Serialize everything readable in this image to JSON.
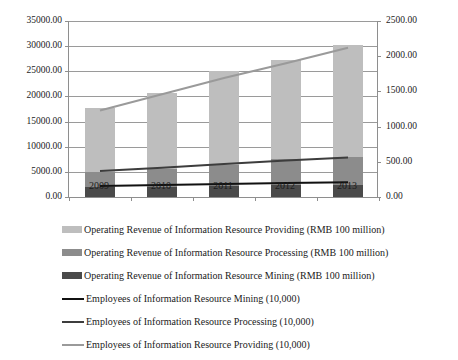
{
  "chart_data": {
    "type": "bar",
    "title": "",
    "subtitle": "",
    "xlabel": "",
    "ylabel": "",
    "categories": [
      "2009",
      "2010",
      "2011",
      "2012",
      "2013"
    ],
    "grid": true,
    "legend_position": "bottom",
    "axes": {
      "left": {
        "label": "",
        "min": 0,
        "max": 35000,
        "step": 5000,
        "ticks": [
          "0.00",
          "5000.00",
          "10000.00",
          "15000.00",
          "20000.00",
          "25000.00",
          "30000.00",
          "35000.00"
        ],
        "tick_values": [
          0,
          5000,
          10000,
          15000,
          20000,
          25000,
          30000,
          35000
        ],
        "unit": "RMB 100 million"
      },
      "right": {
        "label": "",
        "min": 0,
        "max": 2500,
        "step": 500,
        "ticks": [
          "0.00",
          "500.00",
          "1000.00",
          "1500.00",
          "2000.00",
          "2500.00"
        ],
        "tick_values": [
          0,
          500,
          1000,
          1500,
          2000,
          2500
        ],
        "unit": "10,000"
      }
    },
    "stacked": true,
    "series": [
      {
        "name": "Operating Revenue of Information Resource Mining (RMB 100 million)",
        "type": "bar",
        "axis": "left",
        "color": "#4a4a4a",
        "values": [
          1900,
          2000,
          2150,
          2300,
          2400
        ]
      },
      {
        "name": "Operating Revenue of Information Resource Processing (RMB 100 million)",
        "type": "bar",
        "axis": "left",
        "color": "#8c8c8c",
        "values": [
          3100,
          3500,
          4250,
          5200,
          5600
        ]
      },
      {
        "name": "Operating Revenue of Information Resource Providing (RMB 100 million)",
        "type": "bar",
        "axis": "left",
        "color": "#bebebe",
        "values": [
          12800,
          15200,
          18600,
          19800,
          22200
        ]
      },
      {
        "name": "Employees of Information Resource Mining (10,000)",
        "type": "line",
        "axis": "right",
        "color": "#111111",
        "values": [
          155,
          170,
          185,
          200,
          210
        ]
      },
      {
        "name": "Employees of Information Resource Processing (10,000)",
        "type": "line",
        "axis": "right",
        "color": "#3d3d3d",
        "values": [
          370,
          415,
          470,
          520,
          560
        ]
      },
      {
        "name": "Employees of Information Resource Providing (10,000)",
        "type": "line",
        "axis": "right",
        "color": "#9a9a9a",
        "values": [
          1230,
          1460,
          1690,
          1900,
          2120
        ]
      }
    ],
    "bar_totals": [
      17800,
      20700,
      25000,
      27300,
      30200
    ]
  },
  "legend": {
    "items": [
      {
        "label": "Operating Revenue of Information Resource Providing  (RMB 100 million)",
        "marker": "box",
        "color": "#bebebe",
        "icon": "legend-swatch-icon"
      },
      {
        "label": "Operating Revenue of Information Resource Processing  (RMB 100 million)",
        "marker": "box",
        "color": "#8c8c8c",
        "icon": "legend-swatch-icon"
      },
      {
        "label": "Operating Revenue of Information Resource Mining  (RMB 100 million)",
        "marker": "box",
        "color": "#4a4a4a",
        "icon": "legend-swatch-icon"
      },
      {
        "label": "Employees of Information Resource Mining  (10,000)",
        "marker": "line",
        "color": "#111111",
        "icon": "legend-line-icon"
      },
      {
        "label": "Employees of Information Resource Processing  (10,000)",
        "marker": "line",
        "color": "#3d3d3d",
        "icon": "legend-line-icon"
      },
      {
        "label": "Employees of Information Resource Providing  (10,000)",
        "marker": "line",
        "color": "#9a9a9a",
        "icon": "legend-line-icon"
      }
    ]
  }
}
